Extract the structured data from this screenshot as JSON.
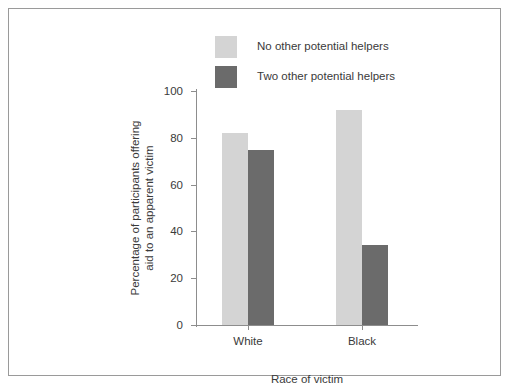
{
  "chart_data": {
    "type": "bar",
    "title": "",
    "xlabel": "Race of victim",
    "ylabel_line1": "Percentage of participants offering",
    "ylabel_line2": "aid to an apparent victim",
    "categories": [
      "White",
      "Black"
    ],
    "series": [
      {
        "name": "No other potential helpers",
        "color": "#d4d4d4",
        "values": [
          82,
          92
        ]
      },
      {
        "name": "Two other potential helpers",
        "color": "#6b6b6b",
        "values": [
          75,
          34
        ]
      }
    ],
    "ylim": [
      0,
      100
    ],
    "yticks": [
      0,
      20,
      40,
      60,
      80,
      100
    ],
    "ytick_labels": [
      "0",
      "20",
      "40",
      "60",
      "80",
      "100"
    ],
    "grid": false,
    "legend_position": "top-center",
    "axis_color": "#8d8d8d",
    "text_color": "#3a3a3a",
    "frame_color": "#9a9a9a",
    "background": "#ffffff"
  }
}
